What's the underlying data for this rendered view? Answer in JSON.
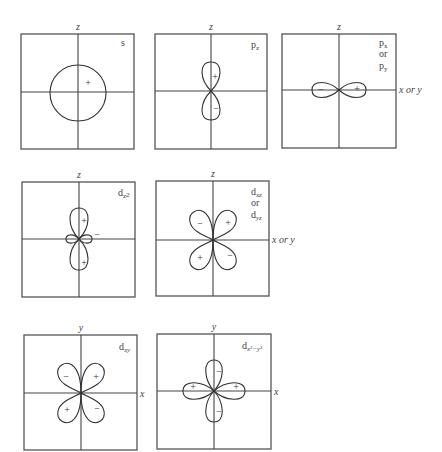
{
  "figure": {
    "panels": [
      {
        "id": "s",
        "label": "s",
        "label_sub": "",
        "vertical_axis": "z",
        "horizontal_axis": "",
        "signs": [
          "+"
        ]
      },
      {
        "id": "pz",
        "label": "p",
        "label_sub": "z",
        "vertical_axis": "z",
        "horizontal_axis": "",
        "signs": [
          "+",
          "−"
        ]
      },
      {
        "id": "px_py",
        "label_lines": [
          {
            "main": "p",
            "sub": "x"
          },
          {
            "main": "or",
            "sub": ""
          },
          {
            "main": "p",
            "sub": "y"
          }
        ],
        "vertical_axis": "z",
        "horizontal_axis": "x or y",
        "signs": [
          "−",
          "+"
        ]
      },
      {
        "id": "dz2",
        "label": "d",
        "label_sub": "z2",
        "vertical_axis": "z",
        "horizontal_axis": "",
        "signs": [
          "+",
          "+",
          "−"
        ]
      },
      {
        "id": "dxz_dyz",
        "label_lines": [
          {
            "main": "d",
            "sub": "xz"
          },
          {
            "main": "or",
            "sub": ""
          },
          {
            "main": "d",
            "sub": "yz"
          }
        ],
        "vertical_axis": "z",
        "horizontal_axis": "x or y",
        "signs": [
          "−",
          "+",
          "+",
          "−"
        ]
      },
      {
        "id": "dxy",
        "label": "d",
        "label_sub": "xy",
        "vertical_axis": "y",
        "horizontal_axis": "x",
        "signs": [
          "−",
          "+",
          "+",
          "−"
        ]
      },
      {
        "id": "dx2y2",
        "label": "d",
        "label_sub": "x²−y²",
        "vertical_axis": "y",
        "horizontal_axis": "x",
        "signs": [
          "−",
          "+",
          "+",
          "−"
        ]
      }
    ]
  }
}
